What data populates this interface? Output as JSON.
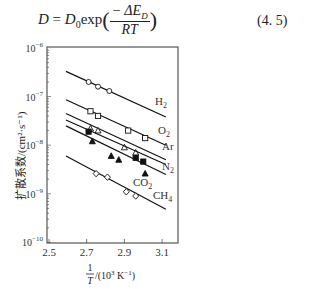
{
  "equation": {
    "lhs": "D",
    "rhs_prefix": "= D",
    "subscript0": "0",
    "func": "exp",
    "numerator": "− ΔE",
    "numerator_sub": "D",
    "denominator": "RT",
    "number": "(4. 5)"
  },
  "chart_data": {
    "type": "line",
    "title": "",
    "xlabel": "1/T /(10³ K⁻¹)",
    "xlabel_num": "1",
    "xlabel_den": "T",
    "xlabel_units": "/(10",
    "xlabel_units_sup": "3",
    "xlabel_units_end": " K",
    "xlabel_units_sup2": "−1",
    "xlabel_units_close": ")",
    "ylabel": "扩散系数/(cm²·s⁻¹)",
    "yscale": "log",
    "xlim": [
      2.5,
      3.15
    ],
    "ylim": [
      1e-10,
      1e-06
    ],
    "xticks": [
      "2.5",
      "2.7",
      "2.9",
      "3.1"
    ],
    "yticks": [
      "10⁻⁶",
      "10⁻⁷",
      "10⁻⁸",
      "10⁻⁹",
      "10⁻¹⁰"
    ],
    "grid": false,
    "series": [
      {
        "name": "H₂",
        "marker": "open-circle",
        "line": [
          [
            2.59,
            3.3e-07
          ],
          [
            3.12,
            3.8e-08
          ]
        ],
        "points": [
          [
            2.71,
            2e-07
          ],
          [
            2.76,
            1.6e-07
          ],
          [
            2.82,
            1.3e-07
          ]
        ]
      },
      {
        "name": "O₂",
        "marker": "open-square",
        "line": [
          [
            2.59,
            8.6e-08
          ],
          [
            3.12,
            1e-08
          ]
        ],
        "points": [
          [
            2.72,
            5e-08
          ],
          [
            2.76,
            4e-08
          ],
          [
            2.92,
            2e-08
          ],
          [
            3.01,
            1.4e-08
          ]
        ]
      },
      {
        "name": "Ar",
        "marker": "open-triangle",
        "line": [
          [
            2.59,
            4.5e-08
          ],
          [
            3.12,
            5e-09
          ]
        ],
        "points": [
          [
            2.72,
            2.2e-08
          ],
          [
            2.76,
            2e-08
          ],
          [
            2.9,
            9e-09
          ],
          [
            2.96,
            7e-09
          ]
        ]
      },
      {
        "name": "N₂",
        "marker": "filled-square",
        "line": [
          [
            2.59,
            3.3e-08
          ],
          [
            3.12,
            4e-09
          ]
        ],
        "points": [
          [
            2.71,
            1.9e-08
          ],
          [
            2.96,
            5.5e-09
          ],
          [
            3.0,
            4.6e-09
          ]
        ]
      },
      {
        "name": "CO₂",
        "marker": "filled-triangle",
        "line": [
          [
            2.59,
            2.5e-08
          ],
          [
            3.12,
            2.5e-09
          ]
        ],
        "points": [
          [
            2.73,
            1.2e-08
          ],
          [
            2.83,
            6e-09
          ],
          [
            2.87,
            5e-09
          ],
          [
            3.01,
            2.6e-09
          ]
        ]
      },
      {
        "name": "CH₄",
        "marker": "open-diamond",
        "line": [
          [
            2.59,
            6e-09
          ],
          [
            3.12,
            4.8e-10
          ]
        ],
        "points": [
          [
            2.75,
            2.6e-09
          ],
          [
            2.81,
            2.2e-09
          ],
          [
            2.91,
            1.1e-09
          ],
          [
            2.96,
            9e-10
          ]
        ]
      }
    ]
  }
}
